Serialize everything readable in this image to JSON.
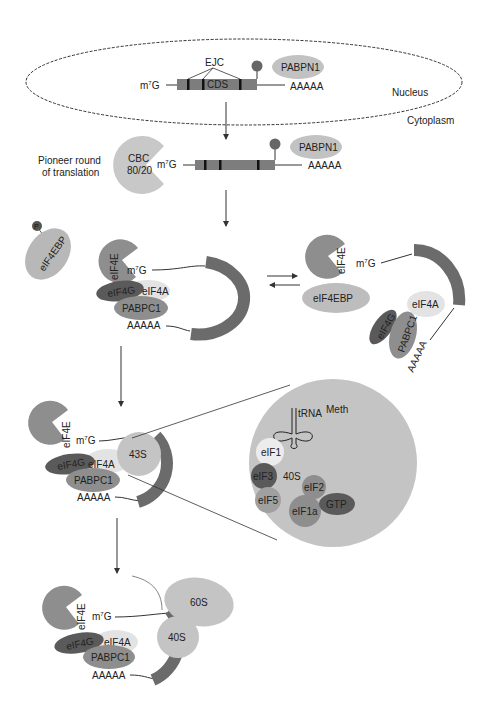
{
  "colors": {
    "background": "#ffffff",
    "mrna_body": "#7d7d7d",
    "dark_protein": "#5a5a5a",
    "mid_protein": "#8e8e8e",
    "light_protein": "#bdbdbd",
    "pale_protein": "#e3e3e3",
    "zoom_circle": "#c4c4c4",
    "line": "#333333"
  },
  "compartments": {
    "nucleus": "Nucleus",
    "cytoplasm": "Cytoplasm"
  },
  "nuclear_mrna": {
    "cap": "m",
    "cap_sup": "7",
    "cap_g": "G",
    "ejc": "EJC",
    "cds": "CDS",
    "pabpn1": "PABPN1",
    "polya": "AAAAA"
  },
  "pioneer": {
    "label_line1": "Pioneer round",
    "label_line2": "of translation",
    "cbc_line1": "CBC",
    "cbc_line2": "80/20",
    "cap": "m",
    "cap_sup": "7",
    "cap_g": "G",
    "pabpn1": "PABPN1",
    "polya": "AAAAA"
  },
  "eif4ebp_free": {
    "phospho": "P",
    "label": "eIF4EBP"
  },
  "closed_loop": {
    "eif4e": "eIF4E",
    "cap": "m",
    "cap_sup": "7",
    "cap_g": "G",
    "eif4g": "eIF4G",
    "eif4a": "eIF4A",
    "pabpc1": "PABPC1",
    "polya": "AAAAA"
  },
  "repressed": {
    "eif4e": "eIF4E",
    "cap": "m",
    "cap_sup": "7",
    "cap_g": "G",
    "eif4ebp": "eIF4EBP",
    "eif4a": "eIF4A",
    "eif4g": "eIF4G",
    "pabpc1": "PABPC1",
    "polya": "AAAAA"
  },
  "scanning": {
    "eif4e": "eIF4E",
    "cap": "m",
    "cap_sup": "7",
    "cap_g": "G",
    "eif4g": "eIF4G",
    "eif4a": "eIF4A",
    "pabpc1": "PABPC1",
    "polya": "AAAAA",
    "complex": "43S"
  },
  "preinitiation_detail": {
    "trna": "tRNA",
    "meth": "Meth",
    "eif1": "eIF1",
    "eif3": "eIF3",
    "subunit": "40S",
    "eif2": "eIF2",
    "eif5": "eIF5",
    "eif1a": "eIF1a",
    "gtp": "GTP"
  },
  "elongation": {
    "eif4e": "eIF4E",
    "cap": "m",
    "cap_sup": "7",
    "cap_g": "G",
    "eif4g": "eIF4G",
    "eif4a": "eIF4A",
    "pabpc1": "PABPC1",
    "polya": "AAAAA",
    "large_subunit": "60S",
    "small_subunit": "40S"
  }
}
